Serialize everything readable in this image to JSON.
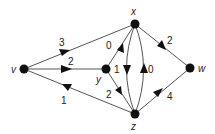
{
  "diagram": {
    "type": "directed-weighted-graph",
    "nodes": [
      {
        "id": "v",
        "label": "v",
        "x": 24,
        "y": 69,
        "label_x": 11,
        "label_y": 73
      },
      {
        "id": "x",
        "label": "x",
        "x": 135,
        "y": 24,
        "label_x": 131,
        "label_y": 15
      },
      {
        "id": "y",
        "label": "y",
        "x": 106,
        "y": 69,
        "label_x": 96,
        "label_y": 82
      },
      {
        "id": "z",
        "label": "z",
        "x": 135,
        "y": 114,
        "label_x": 131,
        "label_y": 130
      },
      {
        "id": "w",
        "label": "w",
        "x": 190,
        "y": 68,
        "label_x": 198,
        "label_y": 72
      }
    ],
    "edges": [
      {
        "from": "v",
        "to": "x",
        "weight": "3",
        "label_x": 62,
        "label_y": 46
      },
      {
        "from": "v",
        "to": "y",
        "weight": "2",
        "label_x": 70,
        "label_y": 65
      },
      {
        "from": "z",
        "to": "v",
        "weight": "1",
        "label_x": 62,
        "label_y": 101
      },
      {
        "from": "y",
        "to": "x",
        "weight": "0",
        "label_x": 108,
        "label_y": 49
      },
      {
        "from": "y",
        "to": "z",
        "weight": "2",
        "label_x": 108,
        "label_y": 97
      },
      {
        "from": "x",
        "to": "z",
        "weight": "1",
        "label_x": 117,
        "label_y": 73
      },
      {
        "from": "z",
        "to": "x",
        "weight": "0",
        "label_x": 146,
        "label_y": 73
      },
      {
        "from": "x",
        "to": "w",
        "weight": "2",
        "label_x": 166,
        "label_y": 45
      },
      {
        "from": "z",
        "to": "w",
        "weight": "4",
        "label_x": 166,
        "label_y": 101
      }
    ]
  }
}
